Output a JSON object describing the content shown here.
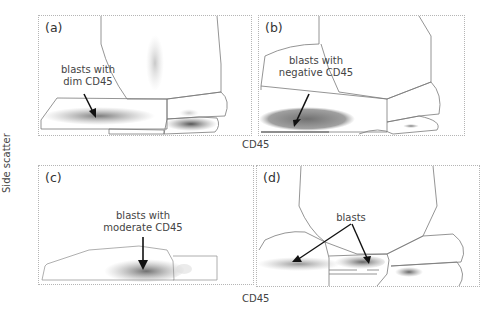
{
  "figure": {
    "y_axis_label": "Side scatter",
    "x_axis_label_top": "CD45",
    "x_axis_label_bottom": "CD45",
    "panels": [
      {
        "id": "a",
        "label": "(a)",
        "annotation_line1": "blasts with",
        "annotation_line2": "dim CD45"
      },
      {
        "id": "b",
        "label": "(b)",
        "annotation_line1": "blasts with",
        "annotation_line2": "negative CD45"
      },
      {
        "id": "c",
        "label": "(c)",
        "annotation_line1": "blasts with",
        "annotation_line2": "moderate CD45"
      },
      {
        "id": "d",
        "label": "(d)",
        "annotation_line1": "blasts"
      }
    ]
  },
  "colors": {
    "gate_line": "#7a7a7a",
    "dots_dark": "#6e6e6e",
    "dots_light": "#a8a8a8",
    "arrow": "#111111"
  }
}
